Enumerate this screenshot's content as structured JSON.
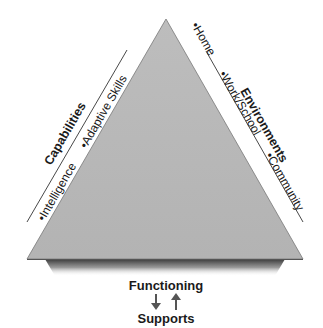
{
  "diagram": {
    "left_side": {
      "heading": "Capabilities",
      "items": [
        "•Intelligence",
        "•Adaptive Skills"
      ]
    },
    "right_side": {
      "heading": "Environments",
      "items": [
        "•Home",
        "•Work/School",
        "•Community"
      ]
    },
    "bottom": {
      "top_label": "Functioning",
      "bottom_label": "Supports",
      "arrows": [
        "arrow-down-icon",
        "arrow-up-icon"
      ]
    },
    "colors": {
      "triangle_fill": "#b9b9b9",
      "triangle_edge": "#777777",
      "text": "#1a1a1a",
      "arrow": "#555555"
    }
  }
}
